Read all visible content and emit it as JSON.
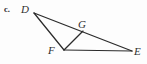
{
  "figure": {
    "item_label": "c.",
    "background_color": "#fdfdfd",
    "stroke_color": "#2b2b2b",
    "label_color": "#2e2e2e",
    "type": "geometry-diagram",
    "points": [
      {
        "name": "D",
        "label": "D",
        "x": 34,
        "y": 13
      },
      {
        "name": "G",
        "label": "G",
        "x": 83,
        "y": 31
      },
      {
        "name": "F",
        "label": "F",
        "x": 64,
        "y": 50
      },
      {
        "name": "E",
        "label": "E",
        "x": 132,
        "y": 51
      }
    ],
    "segments": [
      {
        "name": "segment-D-E",
        "from": "D",
        "to": "E"
      },
      {
        "name": "segment-D-F",
        "from": "D",
        "to": "F"
      },
      {
        "name": "segment-F-G",
        "from": "F",
        "to": "G"
      },
      {
        "name": "segment-F-E",
        "from": "F",
        "to": "E"
      }
    ]
  }
}
